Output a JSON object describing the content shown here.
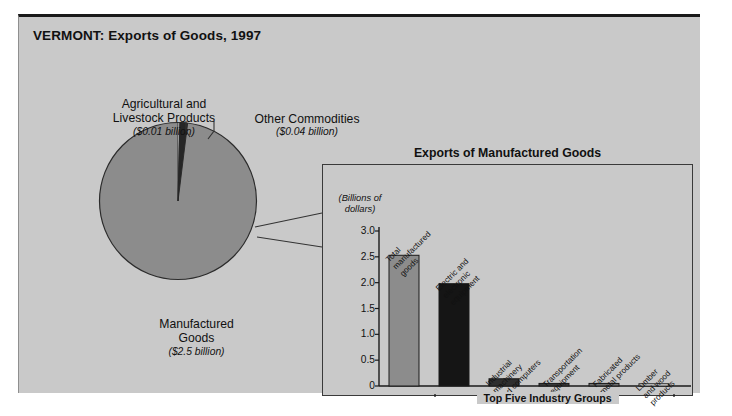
{
  "figure": {
    "title": "VERMONT: Exports of Goods, 1997"
  },
  "pie": {
    "slices": [
      {
        "name": "Agricultural and Livestock Products",
        "label_line1": "Agricultural and",
        "label_line2": "Livestock Products",
        "value_label": "($0.01 billion)",
        "value": 0.01,
        "color": "#f2f2f2"
      },
      {
        "name": "Other Commodities",
        "label_line1": "Other Commodities",
        "label_line2": "",
        "value_label": "($0.04 billion)",
        "value": 0.04,
        "color": "#2b2b2b"
      },
      {
        "name": "Manufactured Goods",
        "label_line1": "Manufactured",
        "label_line2": "Goods",
        "value_label": "($2.5 billion)",
        "value": 2.5,
        "color": "#8c8c8c"
      }
    ]
  },
  "panel": {
    "title": "Exports of Manufactured Goods",
    "axis_unit_line1": "(Billions of",
    "axis_unit_line2": "dollars)",
    "bracket_caption": "Top Five Industry Groups"
  },
  "chart_data": {
    "type": "bar",
    "title": "Exports of Manufactured Goods",
    "xlabel": "",
    "ylabel": "(Billions of dollars)",
    "ylim": [
      0,
      3.0
    ],
    "yticks": [
      "0",
      "0.5",
      "1.0",
      "1.5",
      "2.0",
      "2.5",
      "3.0"
    ],
    "ytick_values": [
      0,
      0.5,
      1.0,
      1.5,
      2.0,
      2.5,
      3.0
    ],
    "grid": false,
    "legend": null,
    "categories": [
      "Total manufactured goods",
      "Electric and electronic equipment",
      "Industrial machinery and computers",
      "Transportation equipment",
      "Fabricated metal products",
      "Lumber and wood products"
    ],
    "category_lines": [
      [
        "Total",
        "manufactured",
        "goods"
      ],
      [
        "Electric and",
        "electronic",
        "equipment"
      ],
      [
        "Industrial",
        "machinery",
        "and computers"
      ],
      [
        "Transportation",
        "equipment"
      ],
      [
        "Fabricated",
        "metal products"
      ],
      [
        "Lumber",
        "and wood",
        "products"
      ]
    ],
    "values": [
      2.53,
      1.98,
      0.14,
      0.05,
      0.05,
      0.03
    ],
    "colors": [
      "#8c8c8c",
      "#151515",
      "#2e2e2e",
      "#3a3a3a",
      "#6e6e6e",
      "#f4f4f4"
    ],
    "annotation": "Top Five Industry Groups"
  }
}
